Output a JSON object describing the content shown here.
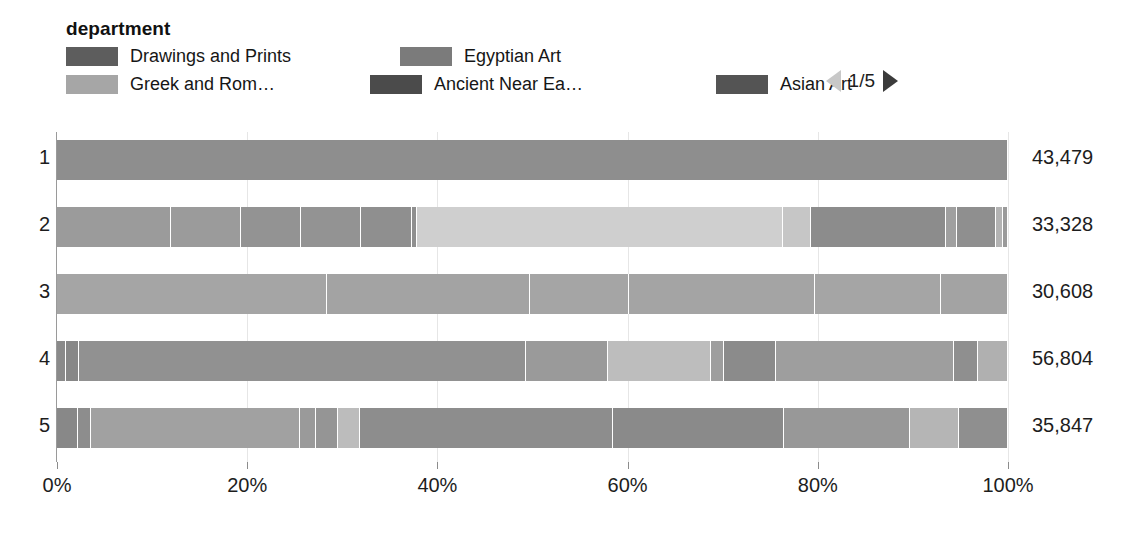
{
  "legend": {
    "title": "department",
    "items": [
      {
        "label": "Drawings and Prints",
        "color": "#5d5d5d"
      },
      {
        "label": "Egyptian Art",
        "color": "#7b7b7b"
      },
      {
        "label": "Greek and Rom…",
        "color": "#a6a6a6"
      },
      {
        "label": "Ancient Near Ea…",
        "color": "#4b4b4b"
      },
      {
        "label": "Asian Art",
        "color": "#545454"
      }
    ],
    "pager": {
      "text": "1/5",
      "prev_icon": "triangle-left-icon",
      "next_icon": "triangle-right-icon",
      "prev_color": "#c8c8c8",
      "next_color": "#3b3b3b"
    }
  },
  "axis": {
    "ticks": [
      "0%",
      "20%",
      "40%",
      "60%",
      "80%",
      "100%"
    ],
    "tick_values": [
      0,
      20,
      40,
      60,
      80,
      100
    ]
  },
  "chart_data": {
    "type": "bar",
    "subtype": "stacked-100-percent-horizontal",
    "title": "",
    "xlabel": "",
    "ylabel": "",
    "xlim": [
      0,
      100
    ],
    "grid": true,
    "legend_position": "top",
    "categories": [
      "1",
      "2",
      "3",
      "4",
      "5"
    ],
    "totals": [
      "43,479",
      "33,328",
      "30,608",
      "56,804",
      "35,847"
    ],
    "total_values": [
      43479,
      33328,
      30608,
      56804,
      35847
    ],
    "rows": [
      {
        "category": "1",
        "total": "43,479",
        "segments": [
          {
            "pct": 100.0,
            "color": "#8e8e8e"
          }
        ]
      },
      {
        "category": "2",
        "total": "33,328",
        "segments": [
          {
            "pct": 12.0,
            "color": "#9b9b9b"
          },
          {
            "pct": 7.4,
            "color": "#9b9b9b"
          },
          {
            "pct": 6.3,
            "color": "#939393"
          },
          {
            "pct": 6.3,
            "color": "#939393"
          },
          {
            "pct": 5.3,
            "color": "#8f8f8f"
          },
          {
            "pct": 0.6,
            "color": "#8f8f8f"
          },
          {
            "pct": 38.4,
            "color": "#cfcfcf"
          },
          {
            "pct": 3.0,
            "color": "#c6c6c6"
          },
          {
            "pct": 14.2,
            "color": "#8c8c8c"
          },
          {
            "pct": 1.1,
            "color": "#a0a0a0"
          },
          {
            "pct": 4.2,
            "color": "#8f8f8f"
          },
          {
            "pct": 0.7,
            "color": "#b3b3b3"
          },
          {
            "pct": 0.5,
            "color": "#9a9a9a"
          }
        ]
      },
      {
        "category": "3",
        "total": "30,608",
        "segments": [
          {
            "pct": 28.4,
            "color": "#a5a5a5"
          },
          {
            "pct": 21.3,
            "color": "#a3a3a3"
          },
          {
            "pct": 10.4,
            "color": "#a5a5a5"
          },
          {
            "pct": 19.6,
            "color": "#a4a4a4"
          },
          {
            "pct": 13.3,
            "color": "#a5a5a5"
          },
          {
            "pct": 7.0,
            "color": "#a3a3a3"
          }
        ]
      },
      {
        "category": "4",
        "total": "56,804",
        "segments": [
          {
            "pct": 0.9,
            "color": "#8a8a8a"
          },
          {
            "pct": 1.4,
            "color": "#878787"
          },
          {
            "pct": 47.0,
            "color": "#919191"
          },
          {
            "pct": 8.6,
            "color": "#9a9a9a"
          },
          {
            "pct": 10.9,
            "color": "#bdbdbd"
          },
          {
            "pct": 1.3,
            "color": "#9e9e9e"
          },
          {
            "pct": 5.5,
            "color": "#8b8b8b"
          },
          {
            "pct": 18.7,
            "color": "#9e9e9e"
          },
          {
            "pct": 2.6,
            "color": "#8f8f8f"
          },
          {
            "pct": 3.1,
            "color": "#b0b0b0"
          }
        ]
      },
      {
        "category": "5",
        "total": "35,847",
        "segments": [
          {
            "pct": 2.2,
            "color": "#888888"
          },
          {
            "pct": 1.4,
            "color": "#8d8d8d"
          },
          {
            "pct": 22.0,
            "color": "#a1a1a1"
          },
          {
            "pct": 1.6,
            "color": "#9a9a9a"
          },
          {
            "pct": 2.3,
            "color": "#959595"
          },
          {
            "pct": 2.4,
            "color": "#bcbcbc"
          },
          {
            "pct": 26.6,
            "color": "#8d8d8d"
          },
          {
            "pct": 18.0,
            "color": "#8a8a8a"
          },
          {
            "pct": 13.2,
            "color": "#989898"
          },
          {
            "pct": 5.2,
            "color": "#b5b5b5"
          },
          {
            "pct": 5.1,
            "color": "#8f8f8f"
          }
        ]
      }
    ]
  }
}
